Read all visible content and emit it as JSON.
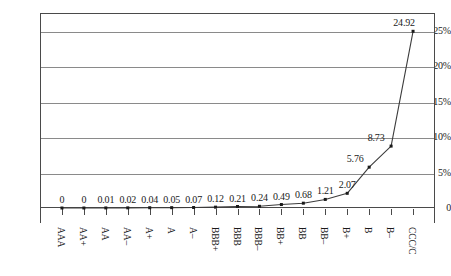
{
  "chart_data": {
    "type": "line",
    "title": "",
    "subtitle": "",
    "xlabel": "",
    "ylabel": "",
    "categories": [
      "AAA",
      "AA+",
      "AA",
      "AA–",
      "A+",
      "A",
      "A–",
      "BBB+",
      "BBB",
      "BBB–",
      "BB+",
      "BB",
      "BB–",
      "B+",
      "B",
      "B–",
      "CCC/C"
    ],
    "values": [
      0,
      0,
      0.01,
      0.02,
      0.04,
      0.05,
      0.07,
      0.12,
      0.21,
      0.24,
      0.49,
      0.68,
      1.21,
      2.07,
      5.76,
      8.73,
      24.92
    ],
    "point_labels": [
      "0",
      "0",
      "0.01",
      "0.02",
      "0.04",
      "0.05",
      "0.07",
      "0.12",
      "0.21",
      "0.24",
      "0.49",
      "0.68",
      "1.21",
      "2.07",
      "5.76",
      "8.73",
      "24.92"
    ],
    "ylim": [
      0,
      27.5
    ],
    "yticks": [
      0,
      5,
      10,
      15,
      20,
      25
    ],
    "ytick_labels": [
      "0",
      "5%",
      "10%",
      "15%",
      "20%",
      "25%"
    ],
    "grid": true,
    "grid_axis": "y",
    "legend": false,
    "legend_position": "none",
    "marker": "square",
    "line_color": "#3c3c3c",
    "marker_color": "#1a1a1a",
    "grid_color": "#8a8a8a",
    "axis_color": "#4a4a4a",
    "background_color": "#ffffff",
    "xlabel_rotation": 90
  }
}
